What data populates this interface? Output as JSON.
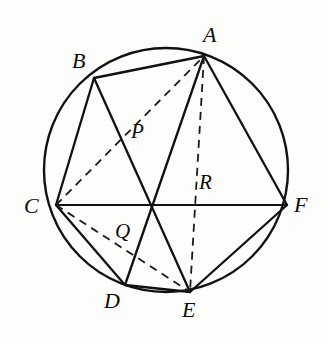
{
  "figure": {
    "kind": "circle-inscribed-hexagon-diagram",
    "background_color": "#fdfdfb",
    "line_color": "#111111",
    "canvas": {
      "width": 330,
      "height": 343
    }
  },
  "circle": {
    "name": "circumscribed-circle",
    "cx": 166,
    "cy": 170,
    "r": 122,
    "stroke_width": 2.4,
    "style": "solid"
  },
  "points": {
    "A": {
      "label": "A",
      "x": 204,
      "y": 56,
      "label_x": 203,
      "label_y": 24,
      "on_circle": true
    },
    "B": {
      "label": "B",
      "x": 94,
      "y": 78,
      "label_x": 72,
      "label_y": 50,
      "on_circle": true
    },
    "C": {
      "label": "C",
      "x": 56,
      "y": 205,
      "label_x": 24,
      "label_y": 195,
      "on_circle": true
    },
    "D": {
      "label": "D",
      "x": 125,
      "y": 285,
      "label_x": 104,
      "label_y": 290,
      "on_circle": true
    },
    "E": {
      "label": "E",
      "x": 190,
      "y": 292,
      "label_x": 182,
      "label_y": 299,
      "on_circle": true
    },
    "F": {
      "label": "F",
      "x": 287,
      "y": 205,
      "label_x": 294,
      "label_y": 194,
      "on_circle": true
    },
    "P": {
      "label": "P",
      "x": 132,
      "y": 137,
      "label_x": 131,
      "label_y": 121,
      "on_circle": false
    },
    "Q": {
      "label": "Q",
      "x": 118,
      "y": 228,
      "label_x": 115,
      "label_y": 221,
      "on_circle": false
    },
    "R": {
      "label": "R",
      "x": 192,
      "y": 205,
      "label_x": 199,
      "label_y": 172,
      "on_circle": false
    },
    "O": {
      "label": "",
      "x": 159,
      "y": 205,
      "label_x": 0,
      "label_y": 0,
      "on_circle": false
    }
  },
  "solid_segments": [
    {
      "name": "segment-AB",
      "from": "A",
      "to": "B",
      "width": 2.3
    },
    {
      "name": "segment-BC",
      "from": "B",
      "to": "C",
      "width": 2.3
    },
    {
      "name": "segment-CF",
      "from": "C",
      "to": "F",
      "width": 2.0
    },
    {
      "name": "segment-AF",
      "from": "A",
      "to": "F",
      "width": 2.3
    },
    {
      "name": "segment-BE",
      "from": "B",
      "to": "E",
      "width": 2.3
    },
    {
      "name": "segment-AD",
      "from": "A",
      "to": "D",
      "width": 2.3
    },
    {
      "name": "segment-CD",
      "from": "C",
      "to": "D",
      "width": 2.3
    },
    {
      "name": "segment-DE",
      "from": "D",
      "to": "E",
      "width": 2.3
    },
    {
      "name": "segment-EF",
      "from": "E",
      "to": "F",
      "width": 2.3
    }
  ],
  "dashed_segments": [
    {
      "name": "segment-CA",
      "from": "C",
      "to": "A",
      "width": 1.8,
      "dash": "8 6"
    },
    {
      "name": "segment-CE",
      "from": "C",
      "to": "E",
      "width": 1.8,
      "dash": "8 6"
    },
    {
      "name": "segment-AE",
      "from": "A",
      "to": "E",
      "width": 1.8,
      "dash": "8 6"
    }
  ],
  "labels": {
    "A": "A",
    "B": "B",
    "C": "C",
    "D": "D",
    "E": "E",
    "F": "F",
    "P": "P",
    "Q": "Q",
    "R": "R"
  }
}
